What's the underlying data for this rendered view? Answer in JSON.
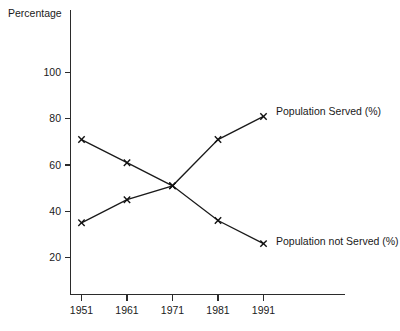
{
  "chart_data": {
    "type": "line",
    "title": "",
    "subtitle": "",
    "xlabel": "",
    "ylabel": "Percentage",
    "ylabel_position": "top-left",
    "categories": [
      "1951",
      "1961",
      "1971",
      "1981",
      "1991"
    ],
    "x": [
      1951,
      1961,
      1971,
      1981,
      1991
    ],
    "xlim": [
      1951,
      1991
    ],
    "ylim": [
      0,
      112
    ],
    "ytick_labels": [
      "20",
      "40",
      "60",
      "80",
      "100"
    ],
    "yticks": [
      20,
      40,
      60,
      80,
      100
    ],
    "xtick_labels": [
      "1951",
      "1961",
      "1971",
      "1981",
      "1991"
    ],
    "grid": false,
    "legend": "inline-right-of-last-point",
    "marker": "x",
    "series": [
      {
        "name": "Population Served (%)",
        "label": "Population Served (%)",
        "values": [
          35,
          45,
          51,
          71,
          81
        ]
      },
      {
        "name": "Population not Served (%)",
        "label": "Population not Served (%)",
        "values": [
          71,
          61,
          51,
          36,
          26
        ]
      }
    ],
    "annotations": [
      {
        "text": "Population Served (%)",
        "series": "Population Served (%)",
        "at_x": 1991,
        "at_y": 81
      },
      {
        "text": "Population not Served (%)",
        "series": "Population not Served (%)",
        "at_x": 1991,
        "at_y": 26
      }
    ],
    "colors": {
      "background": "#ffffff",
      "axis": "#2b2b2b",
      "series_line": "#1a1a1a",
      "text": "#1a1a1a"
    }
  }
}
